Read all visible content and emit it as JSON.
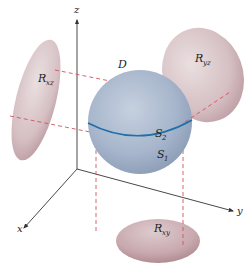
{
  "figure": {
    "axes": {
      "x_label": "x",
      "y_label": "y",
      "z_label": "z"
    },
    "solid": {
      "label": "D",
      "upper_surface": {
        "base": "S",
        "sub": "2"
      },
      "lower_surface": {
        "base": "S",
        "sub": "1"
      }
    },
    "projections": [
      {
        "id": "xz",
        "base": "R",
        "sub": "xz"
      },
      {
        "id": "yz",
        "base": "R",
        "sub": "yz"
      },
      {
        "id": "xy",
        "base": "R",
        "sub": "xy"
      }
    ],
    "colors": {
      "sphere": "#a9b8cf",
      "sphere_highlight": "#c9d3e2",
      "sphere_shadow": "#8293ad",
      "equator": "#1f6fa8",
      "region": "#d8c3c7",
      "region_shadow": "#b8949b",
      "dashed": "#d2525f",
      "axis": "#333333"
    }
  }
}
